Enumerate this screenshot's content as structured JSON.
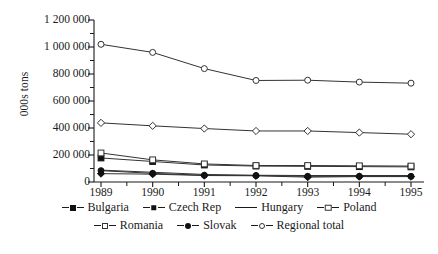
{
  "chart_data": {
    "type": "line",
    "title": "",
    "subtitle": "",
    "xlabel": "",
    "ylabel": "000s tons",
    "x": [
      1989,
      1990,
      1991,
      1992,
      1993,
      1994,
      1995
    ],
    "xtick_labels": [
      "1989",
      "1990",
      "1991",
      "1992",
      "1993",
      "1994",
      "1995"
    ],
    "ytick_labels": [
      "0",
      "200 000",
      "400 000",
      "600 000",
      "800 000",
      "1 000 000",
      "1 200 000"
    ],
    "ytick_values": [
      0,
      200000,
      400000,
      600000,
      800000,
      1000000,
      1200000
    ],
    "ylim": [
      0,
      1200000
    ],
    "xlim": [
      1989,
      1995
    ],
    "grid": false,
    "legend_position": "bottom",
    "minor_xticks": true,
    "series": [
      {
        "name": "Bulgaria",
        "marker": "diamond-filled",
        "values": [
          62000,
          58000,
          48000,
          46000,
          36000,
          40000,
          40000
        ]
      },
      {
        "name": "Czech Rep",
        "marker": "square-filled",
        "values": [
          178000,
          152000,
          126000,
          118000,
          116000,
          114000,
          112000
        ]
      },
      {
        "name": "Hungary",
        "marker": "none",
        "values": [
          88000,
          72000,
          56000,
          50000,
          48000,
          48000,
          48000
        ]
      },
      {
        "name": "Poland",
        "marker": "diamond-open",
        "values": [
          438000,
          416000,
          396000,
          378000,
          378000,
          366000,
          354000
        ]
      },
      {
        "name": "Romania",
        "marker": "square-open",
        "values": [
          215000,
          164000,
          134000,
          122000,
          122000,
          120000,
          118000
        ]
      },
      {
        "name": "Slovak",
        "marker": "circle-filled",
        "values": [
          84000,
          64000,
          50000,
          48000,
          42000,
          42000,
          42000
        ]
      },
      {
        "name": "Regional total",
        "marker": "circle-open",
        "values": [
          1020000,
          960000,
          840000,
          752000,
          754000,
          740000,
          732000
        ]
      }
    ]
  },
  "axes": {
    "y_label": "000s tons"
  },
  "colors": {
    "line": "#333333",
    "marker_fill": "#111111",
    "marker_open": "#ffffff",
    "axis": "#1a1a1a",
    "background": "#ffffff"
  }
}
